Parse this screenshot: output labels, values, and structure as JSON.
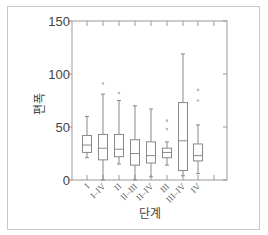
{
  "chart_data": {
    "type": "box",
    "title": "",
    "xlabel": "단계",
    "ylabel": "편폭",
    "ylim": [
      0,
      150
    ],
    "yticks": [
      0,
      50,
      100,
      150
    ],
    "grid": false,
    "categories": [
      "I",
      "I–IV",
      "II",
      "II–III",
      "II–IV",
      "III",
      "III–IV",
      "IV"
    ],
    "boxes": [
      {
        "label": "I",
        "min": 21,
        "q1": 26,
        "median": 33,
        "q3": 42,
        "max": 60,
        "outliers": []
      },
      {
        "label": "I–IV",
        "min": 0,
        "q1": 19,
        "median": 30,
        "q3": 43,
        "max": 81,
        "outliers": [
          91
        ]
      },
      {
        "label": "II",
        "min": 15,
        "q1": 22,
        "median": 29,
        "q3": 43,
        "max": 75,
        "outliers": [
          82
        ]
      },
      {
        "label": "II–III",
        "min": 0,
        "q1": 14,
        "median": 25,
        "q3": 38,
        "max": 70,
        "outliers": []
      },
      {
        "label": "II–IV",
        "min": 3,
        "q1": 16,
        "median": 23,
        "q3": 36,
        "max": 67,
        "outliers": []
      },
      {
        "label": "III",
        "min": 14,
        "q1": 21,
        "median": 26,
        "q3": 30,
        "max": 36,
        "outliers": [
          48,
          56
        ]
      },
      {
        "label": "III–IV",
        "min": 4,
        "q1": 9,
        "median": 37,
        "q3": 73,
        "max": 119,
        "outliers": []
      },
      {
        "label": "IV",
        "min": 6,
        "q1": 18,
        "median": 23,
        "q3": 34,
        "max": 52,
        "outliers": [
          75,
          85
        ]
      }
    ],
    "colors": {
      "box": "#888888",
      "axis": "#999999",
      "outlier": "#bbbbbb"
    }
  }
}
